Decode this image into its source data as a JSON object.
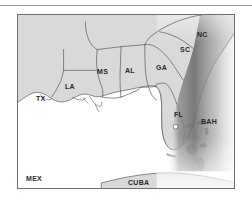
{
  "figure": {
    "kind": "reference-map",
    "top_rule_visible": true
  },
  "colors": {
    "land_fill": "#d9d9d9",
    "ocean_fill": "#ffffff",
    "coastline_stroke": "#5a5a5a",
    "state_border_stroke": "#5a5a5a",
    "frame_stroke": "#6e6e6e",
    "rule_stroke": "#9a9a9a",
    "label_text": "#2a2a2a",
    "gulf_stream_dark": "#6f6f6f",
    "gulf_stream_mid": "#a8a8a8",
    "gulf_stream_light": "#ffffff"
  },
  "map": {
    "frame": {
      "x": 17,
      "y": 14,
      "width": 218,
      "height": 175
    },
    "state_labels": [
      {
        "id": "TX",
        "text": "TX",
        "x": 18,
        "y": 80
      },
      {
        "id": "LA",
        "text": "LA",
        "x": 47,
        "y": 68
      },
      {
        "id": "MS",
        "text": "MS",
        "x": 79,
        "y": 53
      },
      {
        "id": "AL",
        "text": "AL",
        "x": 107,
        "y": 52
      },
      {
        "id": "GA",
        "text": "GA",
        "x": 138,
        "y": 49
      },
      {
        "id": "FL",
        "text": "FL",
        "x": 156,
        "y": 96
      },
      {
        "id": "SC",
        "text": "SC",
        "x": 162,
        "y": 31
      },
      {
        "id": "NC",
        "text": "NC",
        "x": 179,
        "y": 16
      }
    ],
    "region_labels": [
      {
        "id": "MEX",
        "text": "MEX",
        "x": 8,
        "y": 160
      },
      {
        "id": "CUBA",
        "text": "CUBA",
        "x": 110,
        "y": 164
      },
      {
        "id": "BAH",
        "text": "BAH",
        "x": 183,
        "y": 103
      }
    ],
    "features": {
      "gulf_stream_band": "dark-to-light gradient along the Atlantic seaboard from North Carolina south past Florida and the Bahamas",
      "lake_marker": "small open circle in central peninsular Florida",
      "water_body": "Gulf of Mexico (white)",
      "land_shading": "uniform light gray"
    }
  }
}
